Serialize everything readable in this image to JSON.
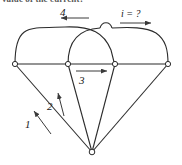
{
  "heading": {
    "text": "value of the current?",
    "note": "clipped-top-text"
  },
  "labels": {
    "branch_4": "4",
    "branch_3": "3",
    "branch_2": "2",
    "branch_1": "1",
    "unknown_current": "i = ?"
  },
  "colors": {
    "stroke": "#2b2b2b",
    "arrow": "#3a3a3a",
    "background": "#ffffff",
    "node_fill": "#ffffff"
  },
  "diagram": {
    "type": "circuit-graph",
    "nodes": [
      {
        "id": "n1",
        "x": 15,
        "y": 64
      },
      {
        "id": "n2",
        "x": 68,
        "y": 64
      },
      {
        "id": "n3",
        "x": 115,
        "y": 64
      },
      {
        "id": "n4",
        "x": 168,
        "y": 64
      },
      {
        "id": "nb",
        "x": 92,
        "y": 152
      }
    ],
    "edges": [
      {
        "from": "n1",
        "to": "n3",
        "shape": "arc-over",
        "label": "4"
      },
      {
        "from": "n2",
        "to": "n4",
        "shape": "arc-over",
        "label": "i = ?"
      },
      {
        "from": "n1",
        "to": "n2",
        "shape": "straight"
      },
      {
        "from": "n2",
        "to": "n3",
        "shape": "straight",
        "label": "3"
      },
      {
        "from": "n3",
        "to": "n4",
        "shape": "straight"
      },
      {
        "from": "n1",
        "to": "nb",
        "shape": "straight",
        "label": "1"
      },
      {
        "from": "n2",
        "to": "nb",
        "shape": "straight",
        "label": "2"
      },
      {
        "from": "n3",
        "to": "nb",
        "shape": "straight"
      },
      {
        "from": "n4",
        "to": "nb",
        "shape": "straight"
      }
    ],
    "arrows": [
      {
        "label": "4",
        "direction": "left",
        "x1": 89,
        "y1": 18,
        "x2": 60,
        "y2": 18
      },
      {
        "label": "i = ?",
        "direction": "right",
        "x1": 120,
        "y1": 22,
        "x2": 152,
        "y2": 22
      },
      {
        "label": "3",
        "direction": "right",
        "x1": 76,
        "y1": 71,
        "x2": 108,
        "y2": 71
      },
      {
        "label": "2",
        "direction": "up",
        "x1": 64,
        "y1": 115,
        "x2": 58,
        "y2": 92
      },
      {
        "label": "1",
        "direction": "up-left",
        "x1": 50,
        "y1": 133,
        "x2": 33,
        "y2": 110
      }
    ]
  }
}
